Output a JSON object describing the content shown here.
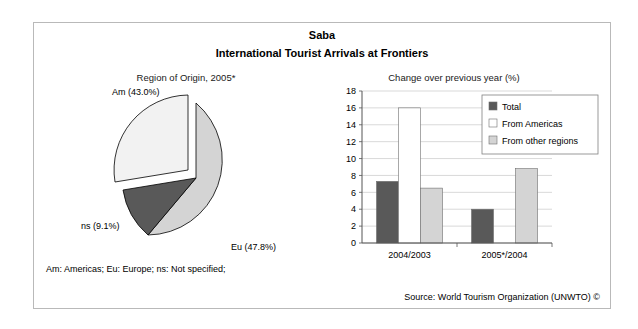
{
  "figure": {
    "title": "Saba",
    "subtitle": "International Tourist Arrivals at Frontiers",
    "footnote": "Am: Americas; Eu: Europe; ns: Not specified;",
    "source": "Source: World Tourism Organization (UNWTO) ©"
  },
  "colors": {
    "total": "#595959",
    "from_americas": "#ffffff",
    "from_other_regions": "#d4d4d4",
    "pie_am": "#f2f2f2",
    "pie_eu": "#d4d4d4",
    "pie_ns": "#595959",
    "outline": "#000000",
    "grid": "#c9c9c9",
    "frame": "#b9b9b9"
  },
  "chart_data": [
    {
      "type": "pie",
      "title": "Region of Origin, 2005*",
      "labels": [
        "Am",
        "Eu",
        "ns"
      ],
      "values": [
        43.0,
        47.8,
        9.1
      ],
      "data_labels": [
        "Am (43.0%)",
        "Eu (47.8%)",
        "ns (9.1%)"
      ],
      "exploded": [
        "Am"
      ],
      "legend": "none"
    },
    {
      "type": "bar",
      "title": "Change over previous year (%)",
      "categories": [
        "2004/2003",
        "2005*/2004"
      ],
      "series": [
        {
          "name": "Total",
          "values": [
            7.3,
            4.0
          ]
        },
        {
          "name": "From Americas",
          "values": [
            16.0,
            0.0
          ]
        },
        {
          "name": "From other regions",
          "values": [
            6.5,
            8.8
          ]
        }
      ],
      "xlabel": "",
      "ylabel": "",
      "ylim": [
        0,
        18
      ],
      "yticks": [
        0,
        2,
        4,
        6,
        8,
        10,
        12,
        14,
        16,
        18
      ],
      "ytick_labels": [
        "0",
        "2",
        "4",
        "6",
        "8",
        "10",
        "12",
        "14",
        "16",
        "18"
      ],
      "grid": true,
      "legend_position": "top-right"
    }
  ]
}
